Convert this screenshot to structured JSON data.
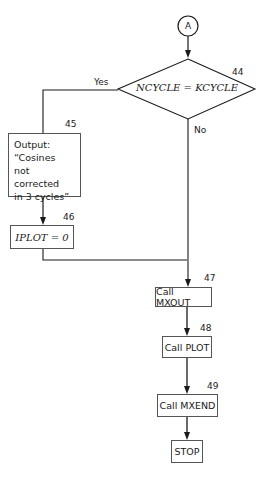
{
  "connector": {
    "label": "A"
  },
  "decision": {
    "number": "44",
    "text": "NCYCLE = KCYCLE",
    "yes_label": "Yes",
    "no_label": "No"
  },
  "output_box": {
    "number": "45",
    "text": "Output:\n“Cosines\nnot corrected\nin 3 cycles”"
  },
  "assign_box": {
    "number": "46",
    "text": "IPLOT = 0"
  },
  "steps": [
    {
      "number": "47",
      "text": "Call MXOUT"
    },
    {
      "number": "48",
      "text": "Call PLOT"
    },
    {
      "number": "49",
      "text": "Call MXEND"
    }
  ],
  "terminal": {
    "text": "STOP"
  },
  "colors": {
    "line": "#1a1a1a",
    "box_border": "#555555",
    "background": "#ffffff"
  }
}
